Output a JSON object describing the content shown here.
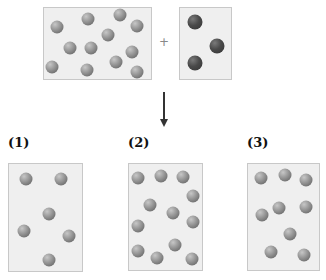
{
  "reactants": {
    "left_box": {
      "x": 43,
      "y": 7,
      "w": 109,
      "h": 73,
      "particles": [
        [
          57,
          27
        ],
        [
          88,
          19
        ],
        [
          120,
          15
        ],
        [
          137,
          26
        ],
        [
          108,
          35
        ],
        [
          70,
          48
        ],
        [
          91,
          48
        ],
        [
          132,
          52
        ],
        [
          52,
          67
        ],
        [
          87,
          70
        ],
        [
          116,
          62
        ],
        [
          137,
          72
        ]
      ]
    },
    "operator": "+",
    "right_box": {
      "x": 179,
      "y": 7,
      "w": 53,
      "h": 73,
      "particles": [
        [
          195,
          22
        ],
        [
          217,
          46
        ],
        [
          195,
          63
        ]
      ]
    }
  },
  "arrow_direction": "down",
  "options": [
    {
      "label": "(1)",
      "x": 8,
      "y": 163,
      "w": 75,
      "h": 109,
      "particles": [
        [
          26,
          179
        ],
        [
          61,
          179
        ],
        [
          49,
          214
        ],
        [
          24,
          231
        ],
        [
          69,
          236
        ],
        [
          49,
          260
        ]
      ]
    },
    {
      "label": "(2)",
      "x": 128,
      "y": 163,
      "w": 75,
      "h": 108,
      "particles": [
        [
          138,
          178
        ],
        [
          161,
          176
        ],
        [
          183,
          177
        ],
        [
          193,
          196
        ],
        [
          150,
          205
        ],
        [
          173,
          213
        ],
        [
          193,
          222
        ],
        [
          138,
          226
        ],
        [
          175,
          245
        ],
        [
          138,
          251
        ],
        [
          157,
          258
        ],
        [
          192,
          259
        ]
      ]
    },
    {
      "label": "(3)",
      "x": 247,
      "y": 163,
      "w": 73,
      "h": 108,
      "particles": [
        [
          261,
          178
        ],
        [
          285,
          175
        ],
        [
          306,
          180
        ],
        [
          279,
          208
        ],
        [
          306,
          207
        ],
        [
          262,
          215
        ],
        [
          290,
          234
        ],
        [
          271,
          252
        ],
        [
          304,
          255
        ]
      ]
    }
  ]
}
